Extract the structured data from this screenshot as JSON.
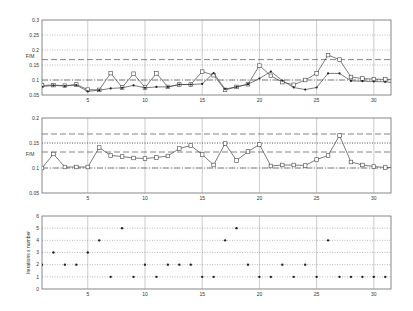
{
  "chart_data": [
    {
      "type": "line",
      "title": "",
      "xlabel": "",
      "ylabel": "F/M",
      "xlim": [
        1,
        31.5
      ],
      "ylim": [
        0.05,
        0.3
      ],
      "xticks": [
        5,
        10,
        15,
        20,
        25,
        30
      ],
      "yticks": [
        0.05,
        0.1,
        0.15,
        0.2,
        0.25,
        0.3
      ],
      "ytick_labels": [
        "0.05",
        "0.1",
        "0.15",
        "0.2",
        "0.25",
        "0.3"
      ],
      "grid": true,
      "reference_lines": [
        {
          "y": 0.168,
          "style": "dashed"
        },
        {
          "y": 0.1,
          "style": "dashdot"
        }
      ],
      "x": [
        1,
        2,
        3,
        4,
        5,
        6,
        7,
        8,
        9,
        10,
        11,
        12,
        13,
        14,
        15,
        16,
        17,
        18,
        19,
        20,
        21,
        22,
        23,
        24,
        25,
        26,
        27,
        28,
        29,
        30,
        31,
        32
      ],
      "series": [
        {
          "name": "series-square",
          "marker": "square",
          "values": [
            0.082,
            0.083,
            0.081,
            0.085,
            0.068,
            0.067,
            0.123,
            0.075,
            0.121,
            0.075,
            0.122,
            0.077,
            0.085,
            0.085,
            0.128,
            0.116,
            0.067,
            0.077,
            0.086,
            0.148,
            0.114,
            0.093,
            0.084,
            0.1,
            0.122,
            0.183,
            0.168,
            0.11,
            0.105,
            0.103,
            0.102,
            0.102
          ]
        },
        {
          "name": "series-dot",
          "marker": "dot",
          "values": [
            0.078,
            0.082,
            0.08,
            0.083,
            0.062,
            0.066,
            0.072,
            0.074,
            0.082,
            0.074,
            0.077,
            0.077,
            0.085,
            0.085,
            0.087,
            0.123,
            0.07,
            0.077,
            0.086,
            0.105,
            0.128,
            0.098,
            0.075,
            0.068,
            0.075,
            0.122,
            0.122,
            0.097,
            0.096,
            0.095,
            0.094,
            0.09
          ]
        }
      ]
    },
    {
      "type": "line",
      "title": "",
      "xlabel": "",
      "ylabel": "F/M",
      "xlim": [
        1,
        31.5
      ],
      "ylim": [
        0.05,
        0.2
      ],
      "xticks": [
        5,
        10,
        15,
        20,
        25,
        30
      ],
      "yticks": [
        0.05,
        0.1,
        0.15,
        0.2
      ],
      "ytick_labels": [
        "0.05",
        "0.1",
        "0.15",
        "0.2"
      ],
      "grid": true,
      "reference_lines": [
        {
          "y": 0.168,
          "style": "dashed"
        },
        {
          "y": 0.15,
          "style": "dotted"
        },
        {
          "y": 0.132,
          "style": "dashed"
        },
        {
          "y": 0.1,
          "style": "dashdot"
        }
      ],
      "x": [
        1,
        2,
        3,
        4,
        5,
        6,
        7,
        8,
        9,
        10,
        11,
        12,
        13,
        14,
        15,
        16,
        17,
        18,
        19,
        20,
        21,
        22,
        23,
        24,
        25,
        26,
        27,
        28,
        29,
        30,
        31,
        32
      ],
      "series": [
        {
          "name": "series-square",
          "marker": "square",
          "values": [
            0.1,
            0.128,
            0.102,
            0.102,
            0.102,
            0.141,
            0.125,
            0.123,
            0.12,
            0.119,
            0.121,
            0.124,
            0.139,
            0.145,
            0.127,
            0.106,
            0.149,
            0.115,
            0.133,
            0.147,
            0.104,
            0.106,
            0.106,
            0.105,
            0.117,
            0.125,
            0.165,
            0.112,
            0.106,
            0.103,
            0.101,
            0.101
          ]
        }
      ]
    },
    {
      "type": "scatter",
      "title": "",
      "xlabel": "",
      "ylabel": "Iterations x number",
      "xlim": [
        1,
        31.5
      ],
      "ylim": [
        0,
        6
      ],
      "xticks": [
        5,
        10,
        15,
        20,
        25,
        30
      ],
      "yticks": [
        0,
        1,
        2,
        3,
        4,
        5,
        6
      ],
      "ytick_labels": [
        "0",
        "1",
        "2",
        "3",
        "4",
        "5",
        "6"
      ],
      "grid": true,
      "x": [
        1,
        2,
        3,
        4,
        5,
        6,
        7,
        8,
        9,
        10,
        11,
        12,
        13,
        14,
        15,
        16,
        17,
        18,
        19,
        20,
        21,
        22,
        23,
        24,
        25,
        26,
        27,
        28,
        29,
        30,
        31
      ],
      "values": [
        2,
        3,
        2,
        2,
        3,
        4,
        1,
        5,
        1,
        2,
        1,
        2,
        2,
        2,
        1,
        1,
        4,
        5,
        2,
        1,
        1,
        2,
        1,
        2,
        1,
        4,
        1,
        1,
        1,
        1,
        1
      ]
    }
  ]
}
